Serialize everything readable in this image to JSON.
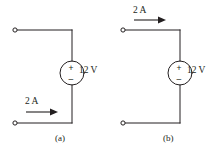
{
  "figure": {
    "type": "electrical-circuit-diagram",
    "background_color": "#ffffff",
    "line_color": "#231f20",
    "subfigure_count": 2
  },
  "circuits": [
    {
      "id": "a",
      "caption": "(a)",
      "source": {
        "kind": "independent-voltage-source",
        "symbol": "circle",
        "polarity_top": "+",
        "polarity_bottom": "–",
        "value_label": "12 V"
      },
      "current": {
        "value_label": "2 A",
        "direction": "right",
        "location": "bottom-wire"
      },
      "terminals": [
        {
          "name": "top-left-terminal",
          "style": "open-circle"
        },
        {
          "name": "bottom-left-terminal",
          "style": "open-circle"
        }
      ]
    },
    {
      "id": "b",
      "caption": "(b)",
      "source": {
        "kind": "independent-voltage-source",
        "symbol": "circle",
        "polarity_top": "+",
        "polarity_bottom": "–",
        "value_label": "12 V"
      },
      "current": {
        "value_label": "2 A",
        "direction": "right",
        "location": "top-wire"
      },
      "terminals": [
        {
          "name": "top-left-terminal",
          "style": "open-circle"
        },
        {
          "name": "bottom-left-terminal",
          "style": "open-circle"
        }
      ]
    }
  ]
}
